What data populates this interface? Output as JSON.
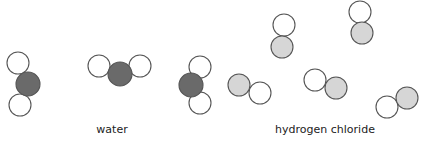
{
  "diagram": {
    "colors": {
      "background": "#ffffff",
      "outline": "#555555",
      "hydrogen": "#ffffff",
      "oxygen": "#6a6a6a",
      "chlorine": "#d6d6d6",
      "label": "#222222"
    },
    "atom_radius": 11,
    "groups": [
      {
        "id": "water",
        "label": "water",
        "label_pos": {
          "x": 112,
          "y": 123
        },
        "molecules": [
          {
            "atoms": [
              {
                "element": "H",
                "x": 18,
                "y": 63
              },
              {
                "element": "H",
                "x": 20,
                "y": 105
              },
              {
                "element": "O",
                "x": 28,
                "y": 84,
                "r": 12
              }
            ]
          },
          {
            "atoms": [
              {
                "element": "H",
                "x": 99,
                "y": 66
              },
              {
                "element": "H",
                "x": 140,
                "y": 66
              },
              {
                "element": "O",
                "x": 120,
                "y": 74,
                "r": 12
              }
            ]
          },
          {
            "atoms": [
              {
                "element": "H",
                "x": 200,
                "y": 67
              },
              {
                "element": "H",
                "x": 200,
                "y": 103
              },
              {
                "element": "O",
                "x": 191,
                "y": 85,
                "r": 12
              }
            ]
          }
        ]
      },
      {
        "id": "hydrogen-chloride",
        "label": "hydrogen chloride",
        "label_pos": {
          "x": 325,
          "y": 123
        },
        "molecules": [
          {
            "atoms": [
              {
                "element": "H",
                "x": 284,
                "y": 25
              },
              {
                "element": "Cl",
                "x": 282,
                "y": 47
              }
            ]
          },
          {
            "atoms": [
              {
                "element": "H",
                "x": 360,
                "y": 12
              },
              {
                "element": "Cl",
                "x": 362,
                "y": 33
              }
            ]
          },
          {
            "atoms": [
              {
                "element": "Cl",
                "x": 239,
                "y": 85
              },
              {
                "element": "H",
                "x": 260,
                "y": 93
              }
            ]
          },
          {
            "atoms": [
              {
                "element": "H",
                "x": 315,
                "y": 80
              },
              {
                "element": "Cl",
                "x": 336,
                "y": 88
              }
            ]
          },
          {
            "atoms": [
              {
                "element": "H",
                "x": 387,
                "y": 107
              },
              {
                "element": "Cl",
                "x": 407,
                "y": 98
              }
            ]
          }
        ]
      }
    ]
  }
}
